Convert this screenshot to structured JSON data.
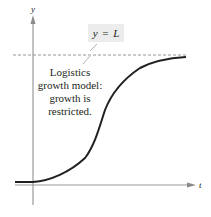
{
  "figure": {
    "axes": {
      "x_label": "t",
      "y_label": "y"
    },
    "asymptote": {
      "label": "y = L",
      "label_parts": {
        "lhs": "y",
        "eq": "=",
        "rhs": "L"
      },
      "style": "dashed"
    },
    "annotation": {
      "lines": [
        "Logistics",
        "growth model:",
        "growth is",
        "restricted."
      ]
    },
    "curve": {
      "type": "logistic",
      "description": "S-shaped curve flat at baseline for t < 0, rising and leveling off toward y = L"
    },
    "colors": {
      "curve": "#231f20",
      "axes": "#9a9a9a",
      "asymptote": "#8a8a8a",
      "label_box": "#ececec",
      "text": "#231f20"
    }
  }
}
